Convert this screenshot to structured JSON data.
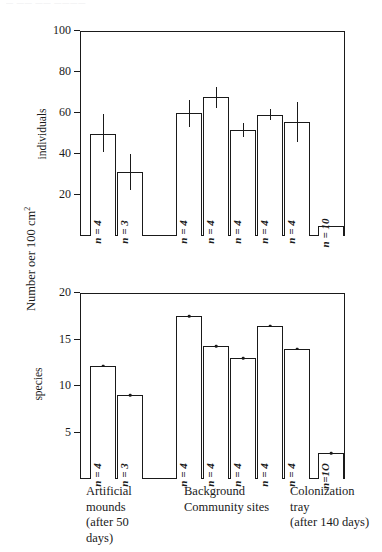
{
  "caption_remnant": "—  ——  —— ————",
  "axis": {
    "main_title_text": "Number oer 100 cm",
    "main_title_sup": "2",
    "individuals_label": "individuals",
    "species_label": "species"
  },
  "chart_data": [
    {
      "type": "bar",
      "id": "individuals-panel",
      "title": "",
      "xlabel": "",
      "ylabel": "individuals",
      "ylim": [
        0,
        100
      ],
      "yticks": [
        20,
        40,
        60,
        80,
        100
      ],
      "ytick_labels": [
        "20",
        "40",
        "60",
        "80",
        "100"
      ],
      "grid": false,
      "legend": "none",
      "categories": [
        "Artificial mound 1",
        "Artificial mound 2",
        "Background site 1",
        "Background site 2",
        "Background site 3",
        "Background site 4",
        "Background site 5",
        "Colonization tray"
      ],
      "values": [
        50,
        31,
        60,
        68,
        51.5,
        59,
        55.5,
        5
      ],
      "errors_low": [
        41,
        22.5,
        53,
        62.5,
        48.5,
        56.5,
        46,
        null
      ],
      "errors_high": [
        59.5,
        40,
        66.5,
        72.5,
        55,
        62,
        65.5,
        null
      ],
      "n_labels": [
        "n = 4",
        "n = 3",
        "n = 4",
        "n = 4",
        "n = 4",
        "n = 4",
        "n = 4",
        "n = 10"
      ]
    },
    {
      "type": "bar",
      "id": "species-panel",
      "title": "",
      "xlabel": "",
      "ylabel": "species",
      "ylim": [
        0,
        20
      ],
      "yticks": [
        5,
        10,
        15,
        20
      ],
      "ytick_labels": [
        "5",
        "10",
        "15",
        "20"
      ],
      "grid": false,
      "legend": "none",
      "categories": [
        "Artificial mound 1",
        "Artificial mound 2",
        "Background site 1",
        "Background site 2",
        "Background site 3",
        "Background site 4",
        "Background site 5",
        "Colonization tray"
      ],
      "values": [
        12.2,
        9,
        17.5,
        14.3,
        13,
        16.5,
        14,
        2.8
      ],
      "n_labels": [
        "n = 4",
        "n = 3",
        "n = 4",
        "n = 4",
        "n = 4",
        "n = 4",
        "n = 4",
        "n=1O"
      ]
    }
  ],
  "xgroups": [
    {
      "name": "artificial-mounds",
      "line1": "Artificial",
      "line2": "mounds",
      "line3": "(after 50",
      "line4": "days)"
    },
    {
      "name": "background-community-sites",
      "line1": "Background",
      "line2": "Community  sites",
      "line3": "",
      "line4": ""
    },
    {
      "name": "colonization-tray",
      "line1": "Colonization",
      "line2": "tray",
      "line3": "(after 140 days)",
      "line4": ""
    }
  ]
}
